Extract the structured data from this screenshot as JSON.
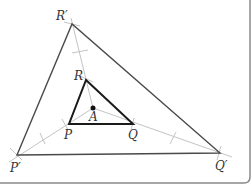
{
  "diagram": {
    "center": {
      "label": "A",
      "x": 93,
      "y": 108
    },
    "small_triangle": {
      "vertices": [
        {
          "label": "P",
          "x": 69,
          "y": 124,
          "lx": 64,
          "ly": 139
        },
        {
          "label": "Q",
          "x": 133,
          "y": 124,
          "lx": 128,
          "ly": 139
        },
        {
          "label": "R",
          "x": 86,
          "y": 80,
          "lx": 74,
          "ly": 80
        }
      ]
    },
    "large_triangle": {
      "vertices": [
        {
          "label": "P′",
          "x": 17,
          "y": 155,
          "lx": 10,
          "ly": 172
        },
        {
          "label": "Q′",
          "x": 220,
          "y": 153,
          "lx": 215,
          "ly": 170
        },
        {
          "label": "R′",
          "x": 72,
          "y": 24,
          "lx": 56,
          "ly": 20
        }
      ]
    },
    "center_label_pos": {
      "lx": 89,
      "ly": 121
    },
    "colors": {
      "small": "#1a1a1a",
      "large": "#4a4a4a",
      "construction": "#bdbdbd",
      "frame": "#8a8a8a"
    }
  }
}
